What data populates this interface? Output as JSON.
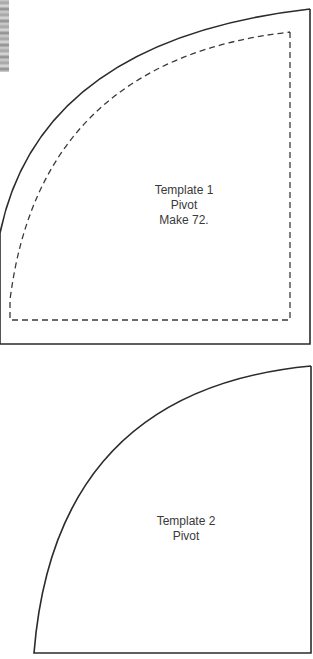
{
  "templates": [
    {
      "title": "Template 1",
      "line2": "Pivot",
      "line3": "Make 72."
    },
    {
      "title": "Template 2",
      "line2": "Pivot"
    }
  ],
  "colors": {
    "outline": "#2b2b2b",
    "dashed": "#3a3a3a",
    "background": "#ffffff",
    "text": "#3a3a3a"
  }
}
